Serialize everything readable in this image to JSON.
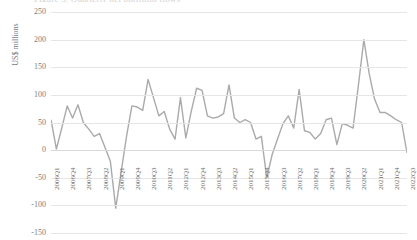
{
  "chart_data": {
    "type": "line",
    "title": "Figure 3. Quarterly net portfolio flows",
    "xlabel": "",
    "ylabel": "US$ millions",
    "ylim": [
      -150,
      250
    ],
    "ytick_values": [
      250,
      200,
      150,
      100,
      50,
      0,
      -50,
      -100,
      -150
    ],
    "ytick_labels": [
      "250",
      "200",
      "150",
      "100",
      "50",
      "0",
      "-50",
      "-100",
      "-150"
    ],
    "grid": true,
    "legend": "none",
    "line_color": "#aaaaaa",
    "line_width": 1.4,
    "xtick_labels": [
      "2006Q1",
      "2006Q4",
      "2007Q3",
      "2008Q2",
      "2009Q1",
      "2009Q4",
      "2010Q3",
      "2011Q2",
      "2012Q1",
      "2012Q4",
      "2013Q3",
      "2014Q2",
      "2015Q1",
      "2015Q4",
      "2016Q3",
      "2017Q2",
      "2018Q1",
      "2018Q4",
      "2019Q3",
      "2020Q2",
      "2021Q1",
      "2021Q4",
      "2022Q3"
    ],
    "xtick_step": 3,
    "x": [
      "2006Q1",
      "2006Q2",
      "2006Q3",
      "2006Q4",
      "2007Q1",
      "2007Q2",
      "2007Q3",
      "2007Q4",
      "2008Q1",
      "2008Q2",
      "2008Q3",
      "2008Q4",
      "2009Q1",
      "2009Q2",
      "2009Q3",
      "2009Q4",
      "2010Q1",
      "2010Q2",
      "2010Q3",
      "2010Q4",
      "2011Q1",
      "2011Q2",
      "2011Q3",
      "2011Q4",
      "2012Q1",
      "2012Q2",
      "2012Q3",
      "2012Q4",
      "2013Q1",
      "2013Q2",
      "2013Q3",
      "2013Q4",
      "2014Q1",
      "2014Q2",
      "2014Q3",
      "2014Q4",
      "2015Q1",
      "2015Q2",
      "2015Q3",
      "2015Q4",
      "2016Q1",
      "2016Q2",
      "2016Q3",
      "2016Q4",
      "2017Q1",
      "2017Q2",
      "2017Q3",
      "2017Q4",
      "2018Q1",
      "2018Q2",
      "2018Q3",
      "2018Q4",
      "2019Q1",
      "2019Q2",
      "2019Q3",
      "2019Q4",
      "2020Q1",
      "2020Q2",
      "2020Q3",
      "2020Q4",
      "2021Q1",
      "2021Q2",
      "2021Q3",
      "2021Q4",
      "2022Q1",
      "2022Q2",
      "2022Q3"
    ],
    "values": [
      55,
      2,
      40,
      80,
      58,
      82,
      50,
      38,
      25,
      30,
      5,
      -20,
      -105,
      -40,
      25,
      80,
      78,
      72,
      128,
      95,
      62,
      70,
      38,
      20,
      95,
      22,
      70,
      112,
      108,
      62,
      58,
      60,
      66,
      118,
      58,
      50,
      55,
      50,
      20,
      25,
      -50,
      -8,
      20,
      48,
      62,
      40,
      110,
      35,
      32,
      20,
      30,
      55,
      58,
      10,
      48,
      45,
      40,
      118,
      200,
      138,
      92,
      68,
      68,
      62,
      55,
      50,
      -5
    ]
  }
}
